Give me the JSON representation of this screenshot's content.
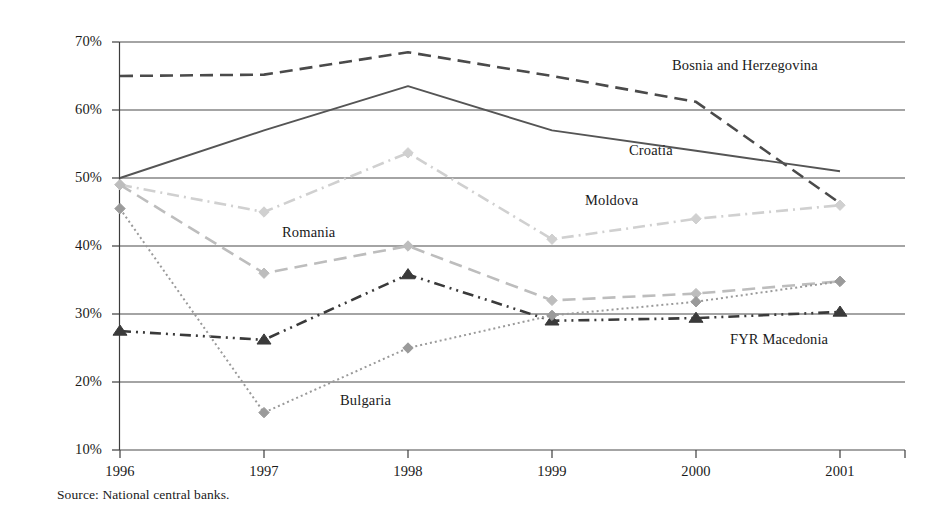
{
  "chart_data": {
    "type": "line",
    "title": "",
    "xlabel": "",
    "ylabel": "",
    "categories": [
      "1996",
      "1997",
      "1998",
      "1999",
      "2000",
      "2001"
    ],
    "x_tick_labels": [
      "1996",
      "1997",
      "1998",
      "1999",
      "2000",
      "2001"
    ],
    "y_tick_labels": [
      "70%",
      "60%",
      "50%",
      "40%",
      "30%",
      "20%",
      "10%"
    ],
    "y_tick_values": [
      70,
      60,
      50,
      40,
      30,
      20,
      10
    ],
    "ylim": [
      10,
      70
    ],
    "grid": "horizontal",
    "legend_position": "inline-annotations",
    "series": [
      {
        "name": "Bosnia and Herzegovina",
        "values": [
          65.0,
          65.2,
          68.5,
          65.0,
          61.2,
          46.3
        ],
        "style": "dashed",
        "color": "#4a4a4a",
        "marker": "none",
        "label_x": 672,
        "label_y": 57
      },
      {
        "name": "Croatia",
        "values": [
          50.0,
          57.0,
          63.5,
          57.0,
          54.0,
          51.0
        ],
        "style": "solid",
        "color": "#555555",
        "marker": "none",
        "label_x": 629,
        "label_y": 142
      },
      {
        "name": "Moldova",
        "values": [
          49.0,
          45.0,
          53.7,
          41.0,
          44.0,
          46.0
        ],
        "style": "dash-dot",
        "color": "#d0d0d0",
        "marker": "diamond",
        "label_x": 585,
        "label_y": 192
      },
      {
        "name": "Romania",
        "values": [
          49.0,
          36.0,
          40.0,
          32.0,
          33.0,
          34.8
        ],
        "style": "dashed",
        "color": "#bdbdbd",
        "marker": "diamond",
        "label_x": 282,
        "label_y": 224
      },
      {
        "name": "FYR Macedonia",
        "values": [
          27.5,
          26.2,
          35.8,
          29.0,
          29.4,
          30.3
        ],
        "style": "dash-dot-dot",
        "color": "#3a3a3a",
        "marker": "triangle",
        "label_x": 730,
        "label_y": 331
      },
      {
        "name": "Bulgaria",
        "values": [
          45.5,
          15.5,
          25.0,
          29.8,
          31.8,
          34.8
        ],
        "style": "dotted",
        "color": "#9a9a9a",
        "marker": "diamond",
        "label_x": 340,
        "label_y": 392
      }
    ]
  },
  "source": {
    "note": "Source: National central banks."
  },
  "colors": {
    "axis": "#3d3d3d",
    "gridline": "#4a4a4a",
    "text": "#1a1a1a",
    "background": "#ffffff"
  }
}
